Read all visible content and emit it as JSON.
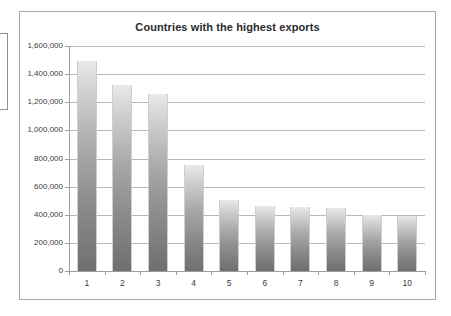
{
  "chart_data": {
    "type": "bar",
    "title": "Countries with the highest exports",
    "xlabel": "",
    "ylabel": "",
    "categories": [
      "1",
      "2",
      "3",
      "4",
      "5",
      "6",
      "7",
      "8",
      "9",
      "10"
    ],
    "values": [
      1490000,
      1320000,
      1260000,
      755000,
      505000,
      465000,
      455000,
      445000,
      398000,
      393000
    ],
    "ylim": [
      0,
      1600000
    ],
    "yticks": [
      0,
      200000,
      400000,
      600000,
      800000,
      1000000,
      1200000,
      1400000,
      1600000
    ],
    "ytick_labels": [
      "0",
      "200,000",
      "400,000",
      "600,000",
      "800,000",
      "1,000,000",
      "1,200,000",
      "1,400,000",
      "1,600,000"
    ],
    "grid": true,
    "legend": "none",
    "series": [
      {
        "name": "Exports",
        "values": [
          1490000,
          1320000,
          1260000,
          755000,
          505000,
          465000,
          455000,
          445000,
          398000,
          393000
        ]
      }
    ],
    "colors": {
      "bar_top": "#e9e9e9",
      "bar_bottom": "#6f6f6f",
      "gridline": "#b9b9b9",
      "axis": "#9d9d9d",
      "frame_border": "#a8a8a8",
      "title_text": "#2b2b2b",
      "tick_text": "#3a3a3a"
    }
  }
}
